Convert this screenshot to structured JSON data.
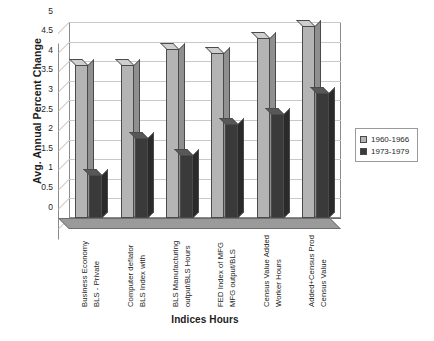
{
  "chart_data": {
    "type": "bar",
    "title": "",
    "xlabel": "Indices Hours",
    "ylabel": "Avg. Annual Percent Change",
    "ylim": [
      0,
      5
    ],
    "yticks": [
      "0",
      "0.5",
      "1",
      "1.5",
      "2",
      "2.5",
      "3",
      "3.5",
      "4",
      "4.5",
      "5"
    ],
    "ytick_values": [
      0,
      0.5,
      1,
      1.5,
      2,
      2.5,
      3,
      3.5,
      4,
      4.5,
      5
    ],
    "grid": true,
    "legend_position": "right",
    "categories": [
      "Business Economy BLS - Private",
      "Computer deflator BLS Index with",
      "BLS Manufacturing output/BLS Hours",
      "FED Index of  MFG MFG output/BLS",
      "Census Value Added Worker Hours",
      "Added+Census Prod Census Value"
    ],
    "category_lines": [
      [
        "Business Economy",
        "BLS - Private"
      ],
      [
        "Computer deflator",
        "BLS Index with"
      ],
      [
        "BLS Manufacturing",
        "output/BLS Hours"
      ],
      [
        "FED Index of  MFG",
        "MFG output/BLS"
      ],
      [
        "Census Value Added",
        "Worker Hours"
      ],
      [
        "Added+Census Prod",
        "Census Value"
      ]
    ],
    "series": [
      {
        "name": "1960-1966",
        "color": "#b4b4b4",
        "values": [
          3.9,
          3.9,
          4.3,
          4.2,
          4.6,
          4.9
        ]
      },
      {
        "name": "1973-1979",
        "color": "#3a3a3a",
        "values": [
          1.1,
          2.05,
          1.6,
          2.4,
          2.65,
          3.2
        ]
      }
    ]
  },
  "legend": {
    "items": [
      {
        "label": "1960-1966"
      },
      {
        "label": "1973-1979"
      }
    ]
  }
}
